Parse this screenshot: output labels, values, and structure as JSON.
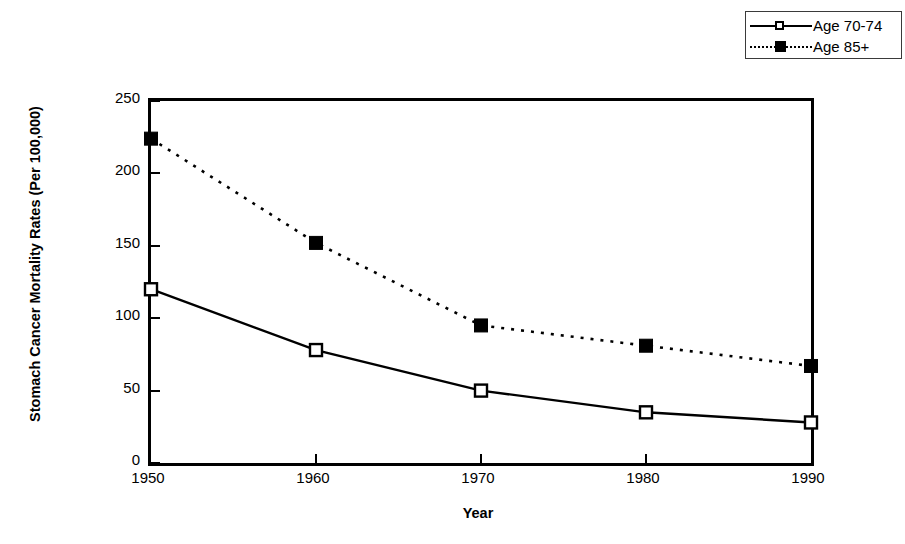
{
  "chart_data": {
    "type": "line",
    "title": "",
    "xlabel": "Year",
    "ylabel": "Stomach Cancer Mortality Rates (Per 100,000)",
    "categories": [
      "1950",
      "1960",
      "1970",
      "1980",
      "1990"
    ],
    "x": [
      1950,
      1960,
      1970,
      1980,
      1990
    ],
    "xlim": [
      1950,
      1990
    ],
    "ylim": [
      0,
      250
    ],
    "yticks": [
      "0",
      "50",
      "100",
      "150",
      "200",
      "250"
    ],
    "ytick_values": [
      0,
      50,
      100,
      150,
      200,
      250
    ],
    "grid": false,
    "legend_position": "top-right",
    "series": [
      {
        "name": "Age 70-74",
        "values": [
          120,
          78,
          50,
          35,
          28
        ],
        "line_style": "solid",
        "marker": "open-square",
        "color": "#000000"
      },
      {
        "name": "Age 85+",
        "values": [
          224,
          152,
          95,
          81,
          67
        ],
        "line_style": "dotted",
        "marker": "filled-square",
        "color": "#000000"
      }
    ]
  },
  "legend": {
    "items": [
      {
        "label": "Age 70-74"
      },
      {
        "label": "Age 85+"
      }
    ]
  }
}
